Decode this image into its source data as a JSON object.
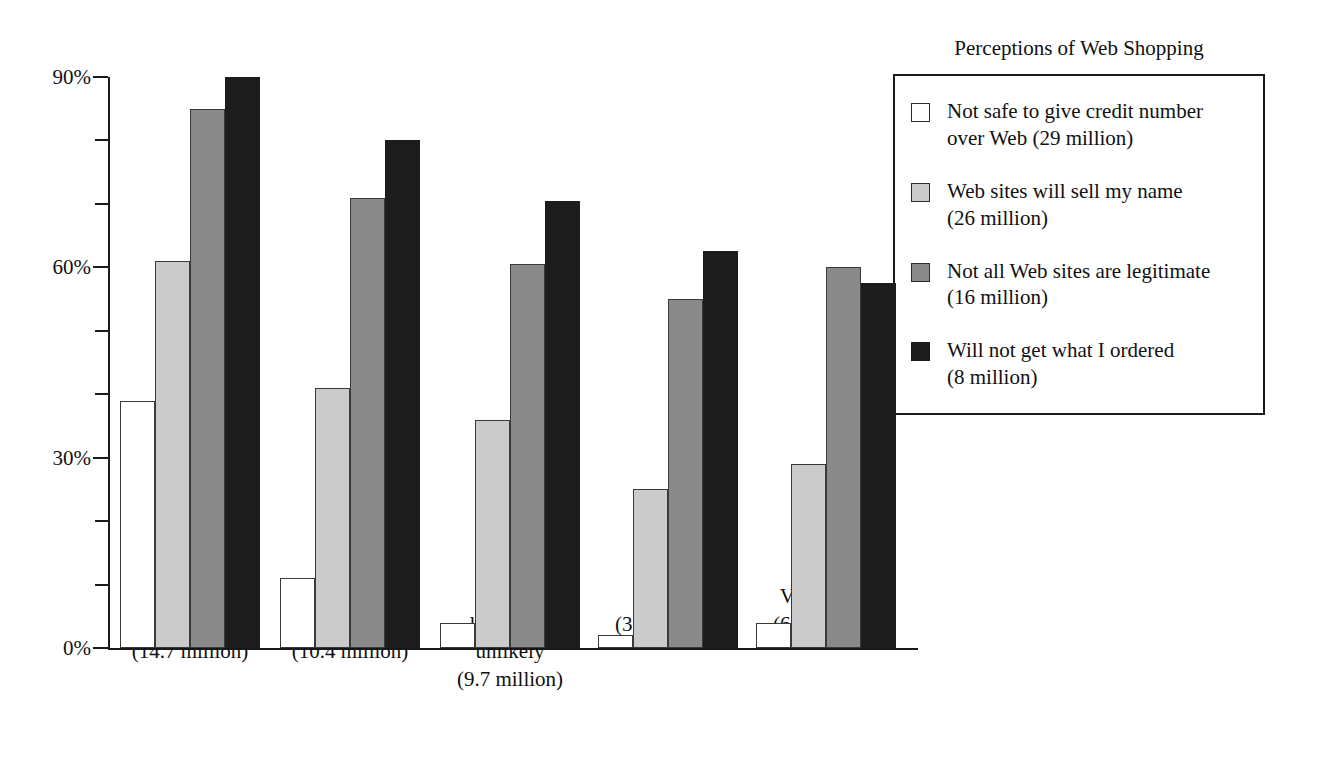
{
  "chart_data": {
    "type": "bar",
    "title": "",
    "xlabel": "",
    "ylabel": "",
    "ylim": [
      0,
      90
    ],
    "grid": false,
    "legend_position": "right",
    "y_ticks": [
      0,
      10,
      20,
      30,
      40,
      50,
      60,
      70,
      80,
      90
    ],
    "y_tick_labels": [
      "0%",
      "",
      "",
      "30%",
      "",
      "",
      "60%",
      "",
      "",
      "90%"
    ],
    "categories": [
      "Not at all\nlikely\n(14.7 million)",
      "Somewhat\nlikely\n(10.4 million)",
      "Neither\nlikely nor\nunlikely\n(9.7 million)",
      "Likely\n(3.4 million)",
      "Very likely\n(6.7 million)"
    ],
    "series": [
      {
        "name": "Not safe to give credit number over Web (29 million)",
        "color": "#ffffff",
        "values": [
          39,
          11,
          4,
          2,
          4
        ]
      },
      {
        "name": "Web sites will sell my name (26 million)",
        "color": "#cbcbcb",
        "values": [
          61,
          41,
          36,
          25,
          29
        ]
      },
      {
        "name": "Not all Web sites are legitimate (16 million)",
        "color": "#8a8a8a",
        "values": [
          85,
          71,
          60.5,
          55,
          60
        ]
      },
      {
        "name": "Will not get what I ordered (8 million)",
        "color": "#1c1c1c",
        "values": [
          90,
          80,
          70.5,
          62.5,
          57.5
        ]
      }
    ]
  },
  "legend": {
    "title": "Perceptions of Web Shopping",
    "items": [
      {
        "label": "Not safe to give credit number\nover Web (29 million)",
        "swatch": "series-0-swatch"
      },
      {
        "label": "Web sites will sell my name\n(26 million)",
        "swatch": "series-1-swatch"
      },
      {
        "label": "Not all Web sites are legitimate\n(16 million)",
        "swatch": "series-2-swatch"
      },
      {
        "label": "Will not get what I ordered\n(8 million)",
        "swatch": "series-3-swatch"
      }
    ]
  }
}
